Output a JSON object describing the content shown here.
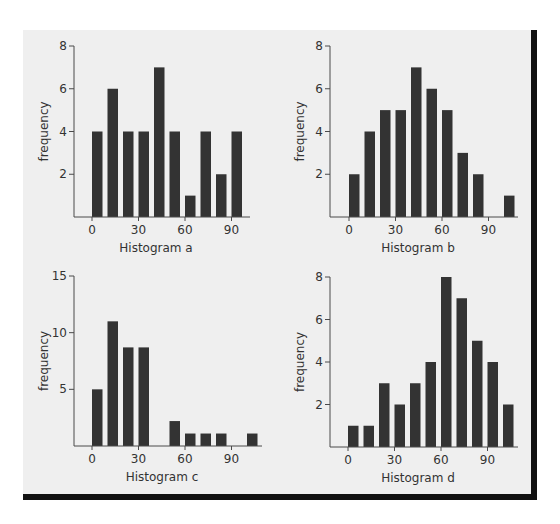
{
  "figure": {
    "background": "#efefef",
    "bar_color": "#333333",
    "frame_color": "#111111"
  },
  "chart_data": [
    {
      "type": "bar",
      "title": "Histogram a",
      "xlabel": "Histogram a",
      "ylabel": "frequency",
      "bin_width": 10,
      "bins": [
        0,
        10,
        20,
        30,
        40,
        50,
        60,
        70,
        80,
        90
      ],
      "values": [
        4,
        6,
        4,
        4,
        7,
        4,
        1,
        4,
        2,
        4
      ],
      "xticks": [
        0,
        30,
        60,
        90
      ],
      "yticks": [
        2,
        4,
        6,
        8
      ],
      "ylim": [
        0,
        8
      ],
      "xlim": [
        0,
        110
      ],
      "grid": false
    },
    {
      "type": "bar",
      "title": "Histogram b",
      "xlabel": "Histogram b",
      "ylabel": "frequency",
      "bin_width": 10,
      "bins": [
        0,
        10,
        20,
        30,
        40,
        50,
        60,
        70,
        80,
        90,
        100
      ],
      "values": [
        2,
        4,
        5,
        5,
        7,
        6,
        5,
        3,
        2,
        0,
        1
      ],
      "xticks": [
        0,
        30,
        60,
        90
      ],
      "yticks": [
        2,
        4,
        6,
        8
      ],
      "ylim": [
        0,
        8
      ],
      "xlim": [
        0,
        115
      ],
      "grid": false
    },
    {
      "type": "bar",
      "title": "Histogram c",
      "xlabel": "Histogram c",
      "ylabel": "frequency",
      "bin_width": 10,
      "bins": [
        0,
        10,
        20,
        30,
        40,
        50,
        60,
        70,
        80,
        90,
        100
      ],
      "values": [
        5,
        11,
        8.7,
        8.7,
        0,
        2.2,
        1.1,
        1.1,
        1.1,
        0,
        1.1
      ],
      "xticks": [
        0,
        30,
        60,
        90
      ],
      "yticks": [
        5,
        10,
        15
      ],
      "ylim": [
        0,
        15
      ],
      "xlim": [
        0,
        115
      ],
      "grid": false
    },
    {
      "type": "bar",
      "title": "Histogram d",
      "xlabel": "Histogram d",
      "ylabel": "frequency",
      "bin_width": 10,
      "bins": [
        0,
        10,
        20,
        30,
        40,
        50,
        60,
        70,
        80,
        90,
        100
      ],
      "values": [
        1,
        1,
        3,
        2,
        3,
        4,
        8,
        7,
        5,
        4,
        2
      ],
      "xticks": [
        0,
        30,
        60,
        90
      ],
      "yticks": [
        2,
        4,
        6,
        8
      ],
      "ylim": [
        0,
        8
      ],
      "xlim": [
        0,
        115
      ],
      "grid": false
    }
  ]
}
